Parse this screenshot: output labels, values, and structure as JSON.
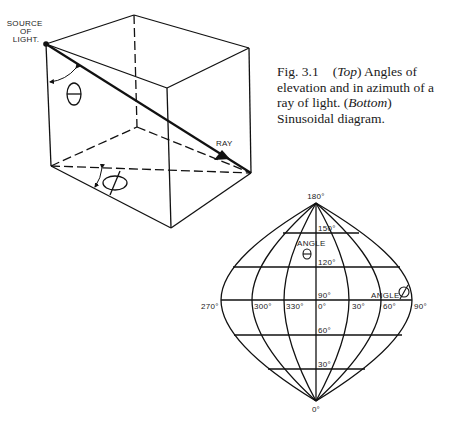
{
  "caption": {
    "fig_number": "Fig. 3.1",
    "top_label": "Top",
    "top_text": "Angles of elevation and in azimuth of a ray of light.",
    "bottom_label": "Bottom",
    "bottom_text": "Sinusoidal diagram."
  },
  "cube": {
    "source_label_lines": [
      "SOURCE",
      "OF",
      "LIGHT."
    ],
    "ray_label": "RAY",
    "elevation_symbol": "Θ",
    "azimuth_symbol": "Ø"
  },
  "sinusoidal": {
    "top_label": "180°",
    "bottom_label": "0°",
    "latitude_labels": [
      "150°",
      "120°",
      "90°",
      "60°",
      "30°"
    ],
    "longitude_labels": [
      "270°",
      "300°",
      "330°",
      "0°",
      "30°",
      "60°",
      "90°"
    ],
    "angle_theta_label": "ANGLE",
    "angle_theta_symbol": "Θ",
    "angle_phi_label": "ANGLE",
    "angle_phi_symbol": "Ø"
  }
}
